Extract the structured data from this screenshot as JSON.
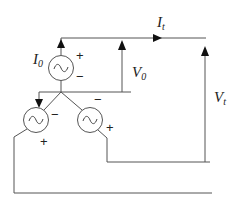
{
  "diagram": {
    "type": "circuit",
    "labels": {
      "source_current": "I",
      "source_current_sub": "0",
      "total_current": "I",
      "total_current_sub": "t",
      "source_voltage": "V",
      "source_voltage_sub": "0",
      "total_voltage": "V",
      "total_voltage_sub": "t"
    },
    "signs": {
      "plus": "+",
      "minus": "−"
    },
    "components": [
      {
        "name": "top-source",
        "symbol": "ac-source",
        "glyph": "~"
      },
      {
        "name": "lower-left-source",
        "symbol": "ac-source",
        "glyph": "~"
      },
      {
        "name": "lower-right-source",
        "symbol": "ac-source",
        "glyph": "~"
      }
    ],
    "colors": {
      "wire": "#555555",
      "arrow": "#111111",
      "text": "#222222"
    }
  }
}
